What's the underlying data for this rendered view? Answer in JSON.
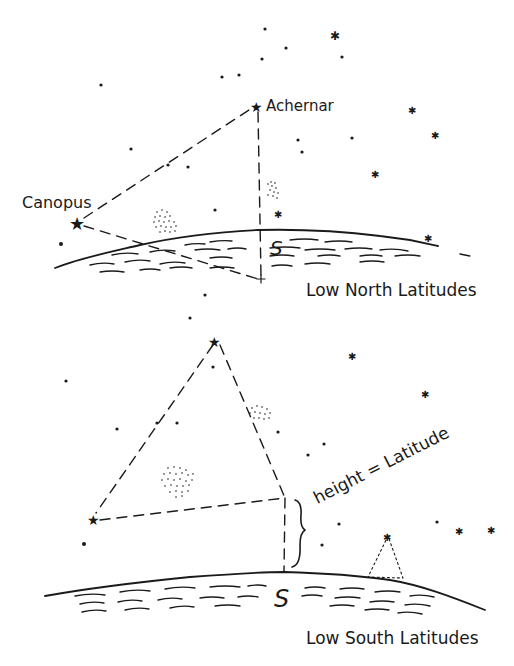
{
  "diagram_title": "Finding latitude from Canopus and Achernar",
  "panels": [
    {
      "name": "Low North Latitudes",
      "stars": {
        "canopus": "Canopus",
        "achernar": "Achernar"
      },
      "south_marker": "S"
    },
    {
      "name": "Low South Latitudes",
      "annotation": "height = Latitude",
      "south_marker": "S"
    }
  ],
  "colors": {
    "ink": "#1a1a1a",
    "background": "#ffffff"
  }
}
